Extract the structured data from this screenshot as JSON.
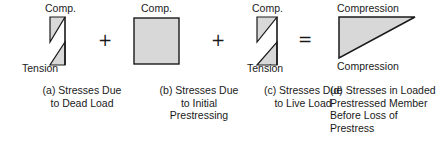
{
  "figure": {
    "type": "engineering-stress-diagram",
    "colors": {
      "line": "#1a1a1a",
      "fill": "#d8d8d8",
      "background": "#ffffff"
    }
  },
  "operators": {
    "plus_1": "+",
    "plus_2": "+",
    "equals": "="
  },
  "panels": [
    {
      "key": "a",
      "top_label": "Comp.",
      "bottom_label": "Tension",
      "shape": "bowtie-left-top-right-bottom",
      "caption_lines": [
        "(a) Stresses Due",
        "to Dead Load"
      ]
    },
    {
      "key": "b",
      "top_label": "Comp.",
      "bottom_label": "",
      "shape": "rectangle",
      "caption_lines": [
        "(b) Stresses Due",
        "to Initial",
        "Prestressing"
      ]
    },
    {
      "key": "c",
      "top_label": "Comp.",
      "bottom_label": "Tension",
      "shape": "bowtie-right-top-left-bottom",
      "caption_lines": [
        "(c) Stresses Due",
        "to Live Load"
      ]
    },
    {
      "key": "d",
      "top_label": "Compression",
      "bottom_label": "Compression",
      "shape": "right-triangle",
      "caption_lines": [
        "(d) Stresses in Loaded",
        "Prestressed Member",
        "Before Loss of",
        "Prestress"
      ]
    }
  ]
}
